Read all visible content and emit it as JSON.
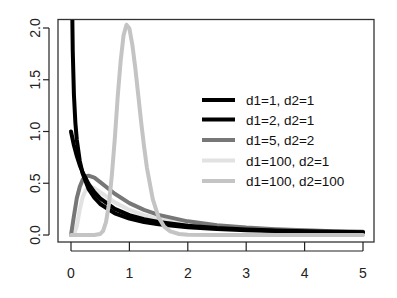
{
  "chart_data": {
    "type": "line",
    "title": "",
    "xlabel": "",
    "ylabel": "",
    "xlim": [
      0,
      5
    ],
    "ylim": [
      0,
      2
    ],
    "grid": false,
    "legend_position": "center-right inside plot",
    "x_ticks": [
      "0",
      "1",
      "2",
      "3",
      "4",
      "5"
    ],
    "y_ticks": [
      "0.0",
      "0.5",
      "1.0",
      "1.5",
      "2.0"
    ],
    "series": [
      {
        "name": "d1=1, d2=1",
        "color": "#000000",
        "width": 4,
        "points": [
          [
            0.003,
            5.8
          ],
          [
            0.01,
            3.15
          ],
          [
            0.02,
            2.21
          ],
          [
            0.03,
            1.78
          ],
          [
            0.05,
            1.357
          ],
          [
            0.075,
            1.084
          ],
          [
            0.1,
            0.918
          ],
          [
            0.15,
            0.716
          ],
          [
            0.2,
            0.593
          ],
          [
            0.3,
            0.446
          ],
          [
            0.4,
            0.36
          ],
          [
            0.5,
            0.3
          ],
          [
            0.75,
            0.21
          ],
          [
            1,
            0.159
          ],
          [
            1.25,
            0.126
          ],
          [
            1.5,
            0.104
          ],
          [
            2,
            0.075
          ],
          [
            2.5,
            0.057
          ],
          [
            3,
            0.046
          ],
          [
            3.5,
            0.038
          ],
          [
            4,
            0.032
          ],
          [
            4.5,
            0.027
          ],
          [
            5,
            0.024
          ]
        ]
      },
      {
        "name": "d1=2, d2=1",
        "color": "#000000",
        "width": 4,
        "points": [
          [
            0,
            1.0
          ],
          [
            0.05,
            0.867
          ],
          [
            0.1,
            0.761
          ],
          [
            0.15,
            0.675
          ],
          [
            0.2,
            0.604
          ],
          [
            0.3,
            0.494
          ],
          [
            0.4,
            0.413
          ],
          [
            0.5,
            0.354
          ],
          [
            0.75,
            0.253
          ],
          [
            1,
            0.192
          ],
          [
            1.25,
            0.152
          ],
          [
            1.5,
            0.125
          ],
          [
            2,
            0.089
          ],
          [
            2.5,
            0.068
          ],
          [
            3,
            0.054
          ],
          [
            3.5,
            0.044
          ],
          [
            4,
            0.037
          ],
          [
            4.5,
            0.032
          ],
          [
            5,
            0.027
          ]
        ]
      },
      {
        "name": "d1=5, d2=2",
        "color": "#777777",
        "width": 4,
        "points": [
          [
            0,
            0
          ],
          [
            0.05,
            0.183
          ],
          [
            0.1,
            0.358
          ],
          [
            0.15,
            0.465
          ],
          [
            0.2,
            0.535
          ],
          [
            0.25,
            0.565
          ],
          [
            0.3,
            0.573
          ],
          [
            0.4,
            0.555
          ],
          [
            0.5,
            0.511
          ],
          [
            0.75,
            0.398
          ],
          [
            1,
            0.308
          ],
          [
            1.25,
            0.243
          ],
          [
            1.5,
            0.194
          ],
          [
            2,
            0.132
          ],
          [
            2.5,
            0.095
          ],
          [
            3,
            0.0717
          ],
          [
            3.5,
            0.056
          ],
          [
            4,
            0.0448
          ],
          [
            4.5,
            0.037
          ],
          [
            5,
            0.0306
          ]
        ]
      },
      {
        "name": "d1=100, d2=1",
        "color": "#e2e2e2",
        "width": 4,
        "points": [
          [
            0,
            0
          ],
          [
            0.05,
            0.002
          ],
          [
            0.1,
            0.085
          ],
          [
            0.15,
            0.245
          ],
          [
            0.2,
            0.366
          ],
          [
            0.25,
            0.43
          ],
          [
            0.3,
            0.459
          ],
          [
            0.35,
            0.462
          ],
          [
            0.4,
            0.452
          ],
          [
            0.5,
            0.415
          ],
          [
            0.75,
            0.315
          ],
          [
            1,
            0.242
          ],
          [
            1.25,
            0.191
          ],
          [
            1.5,
            0.156
          ],
          [
            2,
            0.11
          ],
          [
            2.5,
            0.083
          ],
          [
            3,
            0.065
          ],
          [
            3.5,
            0.053
          ],
          [
            4,
            0.044
          ],
          [
            4.5,
            0.037
          ],
          [
            5,
            0.032
          ]
        ]
      },
      {
        "name": "d1=100, d2=100",
        "color": "#c4c4c4",
        "width": 4,
        "points": [
          [
            0,
            0
          ],
          [
            0.4,
            0.0
          ],
          [
            0.5,
            0.0098
          ],
          [
            0.55,
            0.04
          ],
          [
            0.6,
            0.127
          ],
          [
            0.65,
            0.3
          ],
          [
            0.7,
            0.581
          ],
          [
            0.75,
            0.93
          ],
          [
            0.8,
            1.339
          ],
          [
            0.85,
            1.68
          ],
          [
            0.9,
            1.929
          ],
          [
            0.95,
            2.032
          ],
          [
            1.0,
            1.995
          ],
          [
            1.05,
            1.84
          ],
          [
            1.1,
            1.619
          ],
          [
            1.15,
            1.36
          ],
          [
            1.2,
            1.097
          ],
          [
            1.25,
            0.86
          ],
          [
            1.3,
            0.649
          ],
          [
            1.4,
            0.346
          ],
          [
            1.5,
            0.17
          ],
          [
            1.6,
            0.078
          ],
          [
            1.7,
            0.035
          ],
          [
            1.85,
            0.01
          ],
          [
            2,
            0.0025
          ],
          [
            2.5,
            0.0
          ],
          [
            3,
            0.0
          ],
          [
            4,
            0.0
          ],
          [
            5,
            0.0
          ]
        ]
      }
    ]
  }
}
